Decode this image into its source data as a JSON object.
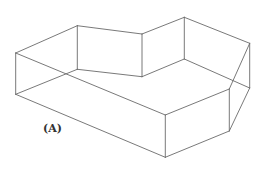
{
  "figure": {
    "label": "(A)",
    "label_pos": {
      "x": 43,
      "y": 123
    },
    "line_color": "#6a6a6a",
    "top_face": [
      [
        15.7,
        53
      ],
      [
        77.3,
        25.7
      ],
      [
        142,
        34
      ],
      [
        184.3,
        17.3
      ],
      [
        249.7,
        43.3
      ],
      [
        229.3,
        89
      ],
      [
        165.3,
        115
      ]
    ],
    "bottom_face": [
      [
        15.7,
        94.3
      ],
      [
        77.3,
        69.3
      ],
      [
        142,
        76.7
      ],
      [
        184.3,
        59
      ],
      [
        249.7,
        88
      ],
      [
        229.3,
        131
      ],
      [
        165.3,
        157.3
      ]
    ]
  }
}
